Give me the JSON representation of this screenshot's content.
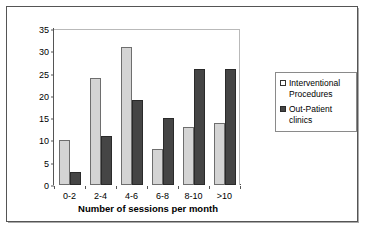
{
  "chart_data": {
    "type": "bar",
    "title": "",
    "xlabel": "Number of sessions per month",
    "ylabel": "% of pain specialists",
    "categories": [
      "0-2",
      "2-4",
      "4-6",
      "6-8",
      "8-10",
      ">10"
    ],
    "series": [
      {
        "name": "Interventional Procedures",
        "values": [
          10,
          24,
          31,
          8,
          13,
          14
        ],
        "color": "#d4d4d4"
      },
      {
        "name": "Out-Patient clinics",
        "values": [
          3,
          11,
          19,
          15,
          26,
          26
        ],
        "color": "#454545"
      }
    ],
    "ylim": [
      0,
      35
    ],
    "yticks": [
      0,
      5,
      10,
      15,
      20,
      25,
      30,
      35
    ],
    "grid": false,
    "legend_position": "right"
  },
  "legend": {
    "items": [
      {
        "label": "Interventional Procedures",
        "marker": "light-square"
      },
      {
        "label": "Out-Patient clinics",
        "marker": "dark-square"
      }
    ]
  }
}
